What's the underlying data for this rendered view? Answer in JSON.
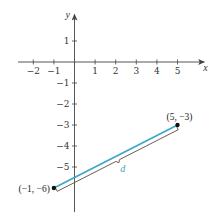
{
  "chart_data": {
    "type": "line",
    "title": "",
    "xlabel": "x",
    "ylabel": "y",
    "xlim": [
      -2.5,
      6.2
    ],
    "ylim": [
      -7.1,
      2.4
    ],
    "grid": false,
    "x_ticks": [
      -2,
      -1,
      1,
      2,
      3,
      4,
      5
    ],
    "x_tick_labels": [
      "−2",
      "−1",
      "1",
      "2",
      "3",
      "4",
      "5"
    ],
    "y_ticks": [
      1,
      -1,
      -2,
      -3,
      -4,
      -5
    ],
    "y_tick_labels": [
      "1",
      "−1",
      "−2",
      "−3",
      "−4",
      "−5"
    ],
    "series": [
      {
        "name": "segment d",
        "x": [
          -1,
          5
        ],
        "y": [
          -6,
          -3
        ],
        "color": "#3aa6c8"
      }
    ],
    "points": [
      {
        "x": -1,
        "y": -6,
        "label": "(−1, −6)"
      },
      {
        "x": 5,
        "y": -3,
        "label": "(5, −3)"
      }
    ],
    "annotations": [
      {
        "type": "brace",
        "label": "d",
        "color": "#3aa6c8",
        "meaning": "distance between (−1, −6) and (5, −3)"
      }
    ]
  },
  "colors": {
    "axis": "#444444",
    "segment": "#3aa6c8",
    "brace": "#5a4a44",
    "point": "#111111"
  }
}
